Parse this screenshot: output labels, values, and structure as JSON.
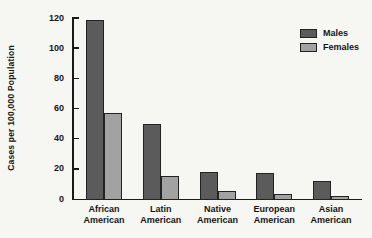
{
  "figure": {
    "background": "#f6f6f3"
  },
  "chart_data": {
    "type": "bar",
    "title": "",
    "xlabel": "",
    "ylabel": "Cases per 100,000 Population",
    "ylim": [
      0,
      120
    ],
    "yticks": [
      0,
      20,
      40,
      60,
      80,
      100,
      120
    ],
    "grid": false,
    "legend_position": "top-right",
    "categories": [
      "African American",
      "Latin American",
      "Native American",
      "European American",
      "Asian American"
    ],
    "series": [
      {
        "name": "Males",
        "color": "#5b5b5b",
        "values": [
          119,
          50,
          18,
          17,
          12
        ]
      },
      {
        "name": "Females",
        "color": "#a2a2a2",
        "values": [
          57,
          15,
          5,
          3,
          2
        ]
      }
    ],
    "bar_border_color": "#222222",
    "axis_color": "#1a1a1a"
  }
}
